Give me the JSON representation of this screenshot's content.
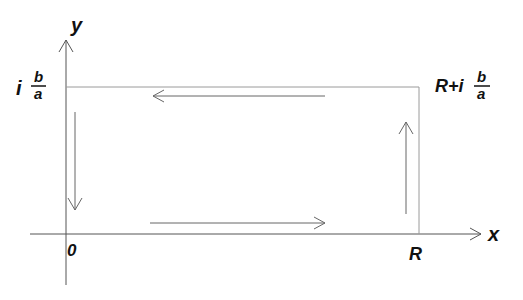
{
  "diagram": {
    "type": "contour-integration-path",
    "axes": {
      "x_label": "x",
      "y_label": "y"
    },
    "labels": {
      "origin": "0",
      "real_corner": "R",
      "imag_corner_prefix": "i",
      "imag_corner_num": "b",
      "imag_corner_den": "a",
      "top_right_prefix": "R+i",
      "top_right_num": "b",
      "top_right_den": "a"
    },
    "vertices": [
      "0",
      "R",
      "R+i b/a",
      "i b/a"
    ],
    "flow_arrows": [
      {
        "edge": "bottom",
        "direction": "right"
      },
      {
        "edge": "right",
        "direction": "up"
      },
      {
        "edge": "top",
        "direction": "left"
      },
      {
        "edge": "left",
        "direction": "down"
      }
    ],
    "colors": {
      "axis": "#555555",
      "rectangle": "#9a9a9a",
      "arrows": "#666666",
      "text": "#111111"
    }
  }
}
